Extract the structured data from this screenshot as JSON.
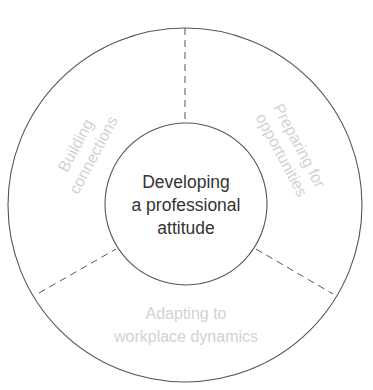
{
  "diagram": {
    "type": "ring-segments",
    "center": {
      "lines": [
        "Developing",
        "a professional",
        "attitude"
      ]
    },
    "segments": [
      {
        "position": "top-left",
        "lines": [
          "Building",
          "connections"
        ]
      },
      {
        "position": "top-right",
        "lines": [
          "Preparing for",
          "opportunities"
        ]
      },
      {
        "position": "bottom",
        "lines": [
          "Adapting to",
          "workplace dynamics"
        ]
      }
    ],
    "colors": {
      "stroke": "#555555",
      "center_text": "#333333",
      "segment_text": "#d2d2d2",
      "background": "#ffffff"
    }
  }
}
